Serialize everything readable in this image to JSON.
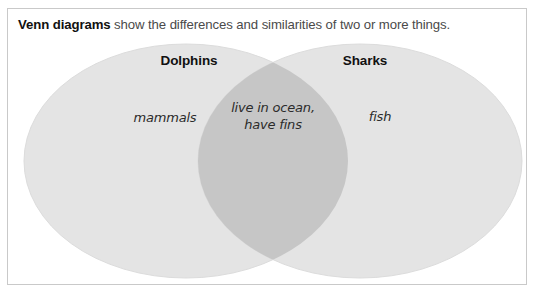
{
  "figure": {
    "caption": {
      "lead": "Venn diagrams",
      "rest": " show the differences and similarities of two or more things."
    }
  },
  "diagram": {
    "type": "venn",
    "sets": [
      {
        "name": "left-set",
        "title": "Dolphins",
        "unique_items": "mammals",
        "fill_color": "#e4e4e4"
      },
      {
        "name": "right-set",
        "title": "Sharks",
        "unique_items": "fish",
        "fill_color": "#e4e4e4"
      }
    ],
    "intersection": {
      "line1": "live in ocean,",
      "line2": "have fins",
      "fill_color": "#c6c6c6"
    },
    "background_color": "#ffffff",
    "frame_color": "#c9c9c9"
  }
}
